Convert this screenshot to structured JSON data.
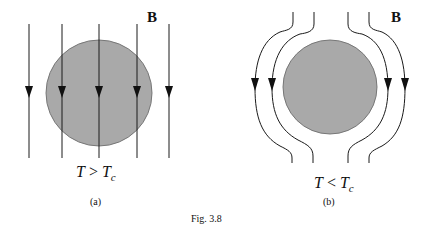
{
  "figure": {
    "caption": "Fig. 3.8",
    "colors": {
      "sample_fill": "#a9a9a9",
      "sample_stroke": "#6e6e6e",
      "field_line": "#1a1a1a",
      "background": "#ffffff"
    },
    "panels": [
      {
        "id": "a",
        "tag": "(a)",
        "field_label": "B",
        "condition": {
          "lhs": "T",
          "op": ">",
          "rhs": "T",
          "rhs_sub": "c"
        },
        "description": "Field lines pass straight through the sample (normal state)"
      },
      {
        "id": "b",
        "tag": "(b)",
        "field_label": "B",
        "condition": {
          "lhs": "T",
          "op": "<",
          "rhs": "T",
          "rhs_sub": "c"
        },
        "description": "Field lines are expelled around the sample (Meissner effect)"
      }
    ]
  }
}
